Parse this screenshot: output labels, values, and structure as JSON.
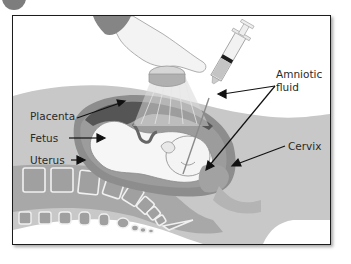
{
  "figure": {
    "labels": {
      "placenta": "Placenta",
      "fetus": "Fetus",
      "uterus": "Uterus",
      "amniotic_fluid_line1": "Amniotic",
      "amniotic_fluid_line2": "fluid",
      "cervix": "Cervix"
    },
    "colors": {
      "frame_border": "#1c1c1c",
      "body_gray": "#c4c4c4",
      "dark_gray": "#7a7a7a",
      "placenta": "#5e5e5e",
      "spine_fill": "#a9a9a9",
      "vertebra_outline": "#f2f2f2",
      "text": "#2a2a2a"
    }
  }
}
